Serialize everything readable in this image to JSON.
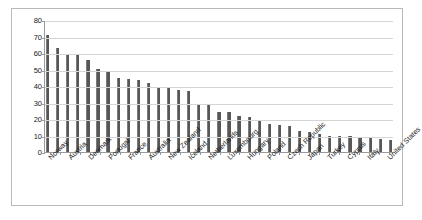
{
  "chart_data": {
    "type": "bar",
    "title": "",
    "subtitle": "",
    "xlabel": "",
    "ylabel": "",
    "ylim": [
      0,
      80
    ],
    "yticks": [
      0,
      10,
      20,
      30,
      40,
      50,
      60,
      70,
      80
    ],
    "grid": true,
    "legend": null,
    "bar_color": "#575757",
    "categories": [
      "Norway",
      "",
      "Austria",
      "",
      "Denmark",
      "",
      "Portugal",
      "",
      "France",
      "",
      "Australia",
      "",
      "New Zealand",
      "",
      "Iceland",
      "",
      "Netherlands",
      "",
      "Luxembourg",
      "",
      "Hungary",
      "",
      "Poland",
      "",
      "Czech Republic",
      "",
      "Japan",
      "",
      "Turkey",
      "",
      "Cyprus",
      "",
      "Italy",
      "",
      "United States"
    ],
    "tick_labels": [
      "Norway",
      "Austria",
      "Denmark",
      "Portugal",
      "France",
      "Australia",
      "New Zealand",
      "Iceland",
      "Netherlands",
      "Luxembourg",
      "Hungary",
      "Poland",
      "Czech Republic",
      "Japan",
      "Turkey",
      "Cyprus",
      "Italy",
      "United States"
    ],
    "values": [
      71,
      63,
      59,
      58.5,
      56,
      50.5,
      48.5,
      45,
      44.5,
      43.5,
      42,
      39.5,
      38.5,
      37.5,
      37,
      28.5,
      28.5,
      24,
      24,
      22,
      21,
      19.5,
      17,
      16.5,
      16,
      12.5,
      12,
      11,
      10,
      9.5,
      9.5,
      9,
      8.5,
      8,
      7
    ],
    "axis_color": "#9a9a9a",
    "grid_color": "#d5d5d5",
    "border_color": "#b9b9b9"
  }
}
